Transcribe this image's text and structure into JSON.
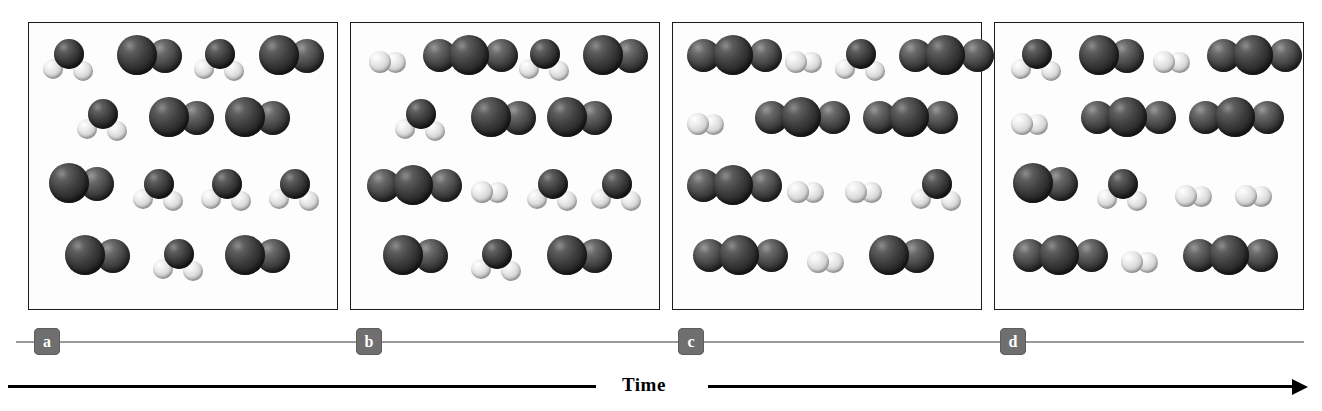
{
  "figure": {
    "title": "",
    "time_axis": {
      "label": "Time",
      "direction": "left-to-right",
      "arrowhead": "arrow-right-icon"
    },
    "colors": {
      "dark_atom": "#3b3b3b",
      "light_atom": "#d4d4d4",
      "panel_border": "#1b1b1b",
      "panel_background": "#fdfdfd",
      "label_badge": "#6f6f6f",
      "label_text": "#ffffff",
      "label_line": "#9a9a9a",
      "time_axis": "#000000"
    },
    "legend_note": "dark spheres = heavy atoms (O / C), light spheres = hydrogen atoms"
  },
  "panels": [
    {
      "id": "a",
      "label": "a",
      "caption": "",
      "molecule_counts": {
        "bent_triatomic": 6,
        "dark_diatomic": 6,
        "light_diatomic": 0,
        "linear_triatomic": 0
      },
      "molecules": [
        {
          "type": "bent-triatomic",
          "x": 14,
          "y": 16
        },
        {
          "type": "dark-diatomic",
          "x": 88,
          "y": 12
        },
        {
          "type": "bent-triatomic",
          "x": 165,
          "y": 16
        },
        {
          "type": "dark-diatomic",
          "x": 230,
          "y": 12
        },
        {
          "type": "bent-triatomic",
          "x": 48,
          "y": 76
        },
        {
          "type": "dark-diatomic",
          "x": 120,
          "y": 74
        },
        {
          "type": "dark-diatomic",
          "x": 196,
          "y": 74
        },
        {
          "type": "dark-diatomic",
          "x": 20,
          "y": 140
        },
        {
          "type": "bent-triatomic",
          "x": 104,
          "y": 146
        },
        {
          "type": "bent-triatomic",
          "x": 172,
          "y": 146
        },
        {
          "type": "bent-triatomic",
          "x": 240,
          "y": 146
        },
        {
          "type": "dark-diatomic",
          "x": 36,
          "y": 212
        },
        {
          "type": "bent-triatomic",
          "x": 124,
          "y": 216
        },
        {
          "type": "dark-diatomic",
          "x": 196,
          "y": 212
        }
      ]
    },
    {
      "id": "b",
      "label": "b",
      "caption": "",
      "molecule_counts": {
        "bent_triatomic": 4,
        "dark_diatomic": 5,
        "light_diatomic": 2,
        "linear_triatomic": 2
      },
      "molecules": [
        {
          "type": "light-diatomic",
          "x": 18,
          "y": 28
        },
        {
          "type": "linear-triatomic",
          "x": 72,
          "y": 12
        },
        {
          "type": "bent-triatomic",
          "x": 168,
          "y": 16
        },
        {
          "type": "dark-diatomic",
          "x": 232,
          "y": 12
        },
        {
          "type": "bent-triatomic",
          "x": 44,
          "y": 76
        },
        {
          "type": "dark-diatomic",
          "x": 120,
          "y": 74
        },
        {
          "type": "dark-diatomic",
          "x": 196,
          "y": 74
        },
        {
          "type": "linear-triatomic",
          "x": 16,
          "y": 142
        },
        {
          "type": "light-diatomic",
          "x": 120,
          "y": 158
        },
        {
          "type": "bent-triatomic",
          "x": 176,
          "y": 146
        },
        {
          "type": "bent-triatomic",
          "x": 240,
          "y": 146
        },
        {
          "type": "dark-diatomic",
          "x": 32,
          "y": 212
        },
        {
          "type": "bent-triatomic",
          "x": 120,
          "y": 216
        },
        {
          "type": "dark-diatomic",
          "x": 196,
          "y": 212
        }
      ]
    },
    {
      "id": "c",
      "label": "c",
      "caption": "",
      "molecule_counts": {
        "bent_triatomic": 2,
        "dark_diatomic": 1,
        "light_diatomic": 4,
        "linear_triatomic": 5
      },
      "molecules": [
        {
          "type": "linear-triatomic",
          "x": 14,
          "y": 12
        },
        {
          "type": "light-diatomic",
          "x": 112,
          "y": 28
        },
        {
          "type": "bent-triatomic",
          "x": 162,
          "y": 16
        },
        {
          "type": "linear-triatomic",
          "x": 226,
          "y": 12
        },
        {
          "type": "light-diatomic",
          "x": 14,
          "y": 90
        },
        {
          "type": "linear-triatomic",
          "x": 82,
          "y": 74
        },
        {
          "type": "linear-triatomic",
          "x": 190,
          "y": 74
        },
        {
          "type": "linear-triatomic",
          "x": 14,
          "y": 142
        },
        {
          "type": "light-diatomic",
          "x": 114,
          "y": 158
        },
        {
          "type": "light-diatomic",
          "x": 172,
          "y": 158
        },
        {
          "type": "bent-triatomic",
          "x": 238,
          "y": 146
        },
        {
          "type": "linear-triatomic",
          "x": 20,
          "y": 212
        },
        {
          "type": "light-diatomic",
          "x": 134,
          "y": 228
        },
        {
          "type": "dark-diatomic",
          "x": 196,
          "y": 212
        }
      ]
    },
    {
      "id": "d",
      "label": "d",
      "caption": "",
      "molecule_counts": {
        "bent_triatomic": 2,
        "dark_diatomic": 2,
        "light_diatomic": 5,
        "linear_triatomic": 5
      },
      "molecules": [
        {
          "type": "bent-triatomic",
          "x": 16,
          "y": 16
        },
        {
          "type": "dark-diatomic",
          "x": 84,
          "y": 12
        },
        {
          "type": "light-diatomic",
          "x": 158,
          "y": 28
        },
        {
          "type": "linear-triatomic",
          "x": 212,
          "y": 12
        },
        {
          "type": "light-diatomic",
          "x": 16,
          "y": 90
        },
        {
          "type": "linear-triatomic",
          "x": 86,
          "y": 74
        },
        {
          "type": "linear-triatomic",
          "x": 194,
          "y": 74
        },
        {
          "type": "dark-diatomic",
          "x": 18,
          "y": 140
        },
        {
          "type": "bent-triatomic",
          "x": 102,
          "y": 146
        },
        {
          "type": "light-diatomic",
          "x": 180,
          "y": 162
        },
        {
          "type": "light-diatomic",
          "x": 240,
          "y": 162
        },
        {
          "type": "linear-triatomic",
          "x": 18,
          "y": 212
        },
        {
          "type": "light-diatomic",
          "x": 126,
          "y": 228
        },
        {
          "type": "linear-triatomic",
          "x": 188,
          "y": 212
        }
      ]
    }
  ]
}
